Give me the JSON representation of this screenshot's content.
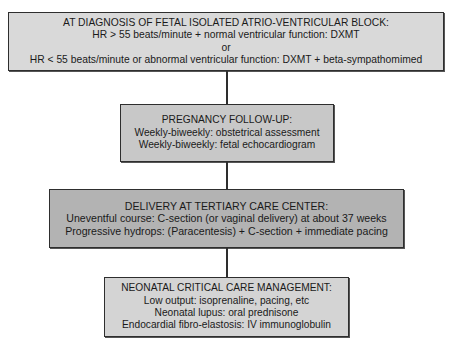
{
  "diagram": {
    "type": "flowchart",
    "direction": "top-to-bottom",
    "boxes": [
      {
        "id": "diagnosis",
        "title": "AT DIAGNOSIS OF FETAL ISOLATED ATRIO-VENTRICULAR BLOCK:",
        "lines": [
          "HR > 55 beats/minute + normal ventricular function: DXMT",
          "or",
          "HR < 55 beats/minute or abnormal ventricular function: DXMT + beta-sympathomimed"
        ],
        "fill": "#d9d9d9"
      },
      {
        "id": "pregnancy-follow-up",
        "title": "PREGNANCY FOLLOW-UP:",
        "lines": [
          "Weekly-biweekly: obstetrical assessment",
          "Weekly-biweekly: fetal echocardiogram"
        ],
        "fill": "#c8c8c8"
      },
      {
        "id": "delivery",
        "title": "DELIVERY AT TERTIARY CARE CENTER:",
        "lines": [
          "Uneventful course: C-section (or vaginal delivery) at about 37 weeks",
          "Progressive hydrops: (Paracentesis) + C-section + immediate pacing"
        ],
        "fill": "#b3b3b3"
      },
      {
        "id": "neonatal-care",
        "title": "NEONATAL CRITICAL CARE MANAGEMENT:",
        "lines": [
          "Low output: isoprenaline, pacing, etc",
          "Neonatal lupus: oral prednisone",
          "Endocardial fibro-elastosis: IV immunoglobulin"
        ],
        "fill": "#d4d4d4"
      }
    ],
    "edges": [
      [
        "diagnosis",
        "pregnancy-follow-up"
      ],
      [
        "pregnancy-follow-up",
        "delivery"
      ],
      [
        "delivery",
        "neonatal-care"
      ]
    ],
    "line_color": "#2e2e2e"
  }
}
